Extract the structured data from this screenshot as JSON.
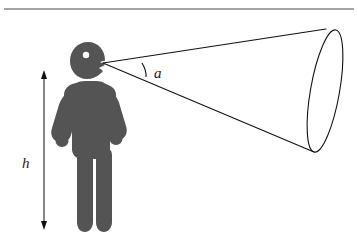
{
  "figure": {
    "type": "geometric-diagram",
    "background_color": "#ffffff"
  },
  "rule": {
    "name": "top-horizontal-rule",
    "color": "#4a4a4a"
  },
  "person": {
    "name": "person-pictogram",
    "fill_color": "#545454",
    "eye_color": "#ffffff"
  },
  "cone": {
    "name": "field-of-view-cone",
    "stroke_color": "#111111",
    "apex_label": "a"
  },
  "labels": {
    "height": "h",
    "angle": "a"
  }
}
